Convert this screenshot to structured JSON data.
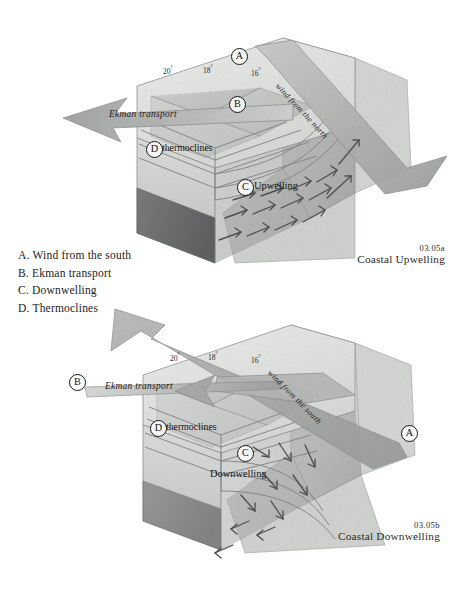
{
  "figure": {
    "title_hidden": "",
    "background": "#ffffff",
    "ink": "#1a1a1a"
  },
  "legend": {
    "name": "key-legend",
    "items": [
      "A. Wind from the south",
      "B. Ekman transport",
      "C. Downwelling",
      "D. Thermoclines"
    ]
  },
  "panels": [
    {
      "id": "upper",
      "caption_number": "03.05a",
      "caption_text": "Coastal Upwelling",
      "wind_label": "wind from the north",
      "ekman_label": "Ekman transport",
      "thermocline_label": "thermoclines",
      "process_label": "Upwelling",
      "markers": {
        "a": "A",
        "b": "B",
        "c": "C",
        "d": "D"
      },
      "isotherms": [
        "20",
        "18",
        "16"
      ],
      "degree": "°"
    },
    {
      "id": "lower",
      "caption_number": "03.05b",
      "caption_text": "Coastal Downwelling",
      "wind_label": "wind from the south",
      "ekman_label": "Ekman transport",
      "thermocline_label": "thermoclines",
      "process_label": "Downwelling",
      "markers": {
        "a": "A",
        "b": "B",
        "c": "C",
        "d": "D"
      },
      "isotherms": [
        "20",
        "18",
        "16"
      ],
      "degree": "°"
    }
  ],
  "colors": {
    "water_light": "#e3e5e3",
    "water_mid": "#cfd2cf",
    "water_dark": "#b3b6b3",
    "block_side": "#8e9190",
    "block_deep": "#6e7170",
    "land": "#d8dad6",
    "arrow": "#4a4d4c",
    "outline": "#7d807e"
  }
}
